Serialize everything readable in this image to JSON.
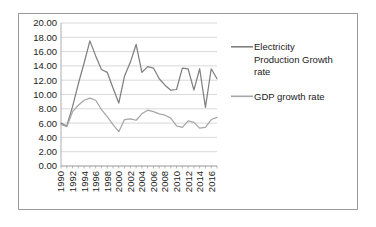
{
  "chart_data": {
    "type": "line",
    "title": "",
    "xlabel": "",
    "ylabel": "",
    "ylim": [
      0,
      20
    ],
    "ytick_step": 2,
    "ytick_labels": [
      "0.00",
      "2.00",
      "4.00",
      "6.00",
      "8.00",
      "10.00",
      "12.00",
      "14.00",
      "16.00",
      "18.00",
      "20.00"
    ],
    "grid": true,
    "legend_position": "right",
    "x": [
      1990,
      1991,
      1992,
      1993,
      1994,
      1995,
      1996,
      1997,
      1998,
      1999,
      2000,
      2001,
      2002,
      2003,
      2004,
      2005,
      2006,
      2007,
      2008,
      2009,
      2010,
      2011,
      2012,
      2013,
      2014,
      2015,
      2016,
      2017
    ],
    "xtick_labels": [
      "1990",
      "1992",
      "1994",
      "1996",
      "1998",
      "2000",
      "2002",
      "2004",
      "2006",
      "2008",
      "2010",
      "2012",
      "2014",
      "2016"
    ],
    "xtick_values": [
      1990,
      1992,
      1994,
      1996,
      1998,
      2000,
      2002,
      2004,
      2006,
      2008,
      2010,
      2012,
      2014,
      2016
    ],
    "series": [
      {
        "name": "Electricity Production Growth rate",
        "color": "#808080",
        "values": [
          6.0,
          5.6,
          8.3,
          11.5,
          14.4,
          17.5,
          15.4,
          13.5,
          13.1,
          10.9,
          8.8,
          12.6,
          14.5,
          17.0,
          13.1,
          13.9,
          13.7,
          12.2,
          11.3,
          10.6,
          10.7,
          13.7,
          13.6,
          10.6,
          13.6,
          8.2,
          13.6,
          12.2
        ]
      },
      {
        "name": "GDP growth rate",
        "color": "#a6a6a6",
        "values": [
          5.8,
          5.5,
          7.6,
          8.5,
          9.2,
          9.5,
          9.2,
          7.9,
          6.9,
          5.8,
          4.8,
          6.5,
          6.6,
          6.4,
          7.3,
          7.8,
          7.6,
          7.3,
          7.1,
          6.7,
          5.6,
          5.4,
          6.3,
          6.1,
          5.3,
          5.4,
          6.5,
          6.8
        ]
      }
    ],
    "legend_entries": [
      {
        "label_lines": [
          "Electricity",
          "Production Growth",
          "rate"
        ],
        "color": "#808080"
      },
      {
        "label_lines": [
          "GDP growth rate"
        ],
        "color": "#a6a6a6"
      }
    ]
  }
}
